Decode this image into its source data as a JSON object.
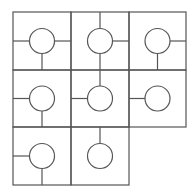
{
  "diagram": {
    "type": "tile-grid",
    "rows": 3,
    "cols": 3,
    "stroke_color": "#555555",
    "circle_color": "#555555",
    "background": "#ffffff",
    "col_edges": [
      13,
      71,
      129,
      186
    ],
    "row_edges": [
      12,
      70,
      127,
      185
    ],
    "circle_radius": 12.5,
    "tiles": [
      {
        "row": 0,
        "col": 0,
        "connections": [
          "left",
          "right",
          "bottom"
        ]
      },
      {
        "row": 0,
        "col": 1,
        "connections": [
          "top",
          "right",
          "bottom"
        ]
      },
      {
        "row": 0,
        "col": 2,
        "connections": [
          "right",
          "bottom"
        ]
      },
      {
        "row": 1,
        "col": 0,
        "connections": [
          "left",
          "bottom"
        ]
      },
      {
        "row": 1,
        "col": 1,
        "connections": [
          "top",
          "left"
        ]
      },
      {
        "row": 1,
        "col": 2,
        "connections": [
          "left"
        ]
      },
      {
        "row": 2,
        "col": 0,
        "connections": [
          "left",
          "bottom"
        ]
      },
      {
        "row": 2,
        "col": 1,
        "connections": [
          "top"
        ]
      }
    ]
  }
}
